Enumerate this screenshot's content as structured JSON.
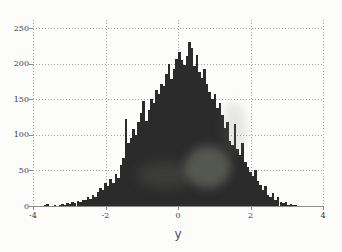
{
  "colors": {
    "background": "#fcfcfb",
    "bar": "#2b2b2b",
    "grid": "#a3a3a3",
    "grid_strong": "#8c8c8c",
    "tick_label": "#3a3a3a",
    "axis_label": "#4d4d4d"
  },
  "chart_data": {
    "type": "bar",
    "subtype": "histogram",
    "title": "",
    "xlabel": "y",
    "ylabel": "",
    "xlim": [
      -4,
      4
    ],
    "ylim": [
      0,
      250
    ],
    "grid": true,
    "legend": false,
    "x_ticks": [
      {
        "label": "-4",
        "value": -4
      },
      {
        "label": "-2",
        "value": -2
      },
      {
        "label": "0",
        "value": 0
      },
      {
        "label": "2",
        "value": 2
      },
      {
        "label": "4",
        "value": 4
      }
    ],
    "y_ticks": [
      {
        "label": "0",
        "value": 0
      },
      {
        "label": "50",
        "value": 50
      },
      {
        "label": "100",
        "value": 100
      },
      {
        "label": "150",
        "value": 150
      },
      {
        "label": "200",
        "value": 200
      },
      {
        "label": "250",
        "value": 250
      }
    ],
    "bins": {
      "start": -3.71,
      "width": 0.07,
      "count": 100
    },
    "values": [
      2,
      3,
      0,
      0,
      1,
      0,
      2,
      3,
      2,
      4,
      3,
      5,
      4,
      7,
      5,
      9,
      8,
      13,
      10,
      16,
      13,
      20,
      25,
      22,
      32,
      28,
      38,
      33,
      45,
      40,
      58,
      68,
      122,
      88,
      95,
      108,
      100,
      118,
      130,
      148,
      120,
      135,
      150,
      145,
      163,
      158,
      172,
      168,
      185,
      199,
      178,
      192,
      207,
      217,
      205,
      198,
      210,
      230,
      222,
      196,
      212,
      188,
      180,
      192,
      172,
      160,
      150,
      158,
      138,
      145,
      128,
      110,
      118,
      92,
      85,
      115,
      80,
      72,
      88,
      62,
      55,
      48,
      42,
      50,
      35,
      30,
      22,
      28,
      16,
      12,
      18,
      9,
      12,
      6,
      4,
      5,
      2,
      3,
      1,
      2
    ]
  }
}
